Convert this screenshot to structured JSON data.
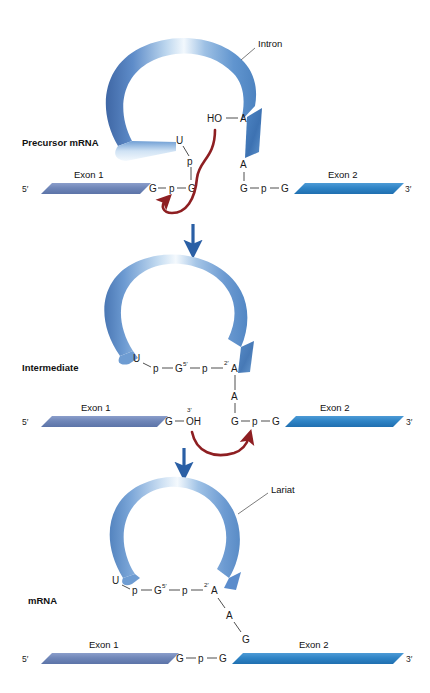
{
  "figure": {
    "background": "#ffffff"
  },
  "colors": {
    "exon1": "#6f86b8",
    "exon1_dark": "#5c74a8",
    "exon2": "#2f84c6",
    "exon2_dark": "#1f6fb0",
    "intron_mid": "#5b8ccc",
    "intron_dark": "#35609f",
    "intron_light": "#eaf2fb",
    "reaction_arrow": "#8e1f22",
    "step_arrow": "#2a5fa5",
    "text": "#111111",
    "bond": "#3b3b3b"
  },
  "stages": [
    {
      "id": "precursor",
      "label": "Precursor mRNA",
      "callout": "Intron",
      "left_terminus": "5′",
      "right_terminus": "3′",
      "exon1_label": "Exon 1",
      "exon2_label": "Exon 2",
      "branch_hydroxyl": "HO",
      "branch_base": "A",
      "branch_base_2": "A",
      "loop_nucleotides": [
        "U",
        "p",
        "G"
      ],
      "donor_chain": [
        "G",
        "p",
        "G"
      ],
      "acceptor_chain": [
        "G",
        "p",
        "G"
      ]
    },
    {
      "id": "intermediate",
      "label": "Intermediate",
      "left_terminus": "5′",
      "right_terminus": "3′",
      "exon1_label": "Exon 1",
      "exon2_label": "Exon 2",
      "lariat_chain": [
        "U",
        "p",
        "G",
        "p",
        "A"
      ],
      "lariat_sup_g": "5′",
      "lariat_sup_a": "2′",
      "branch_base_2": "A",
      "exon1_end": "G",
      "exon1_hydroxyl": "OH",
      "exon1_hydroxyl_sup": "3′",
      "acceptor_chain": [
        "G",
        "p",
        "G"
      ]
    },
    {
      "id": "mrna",
      "label": "mRNA",
      "callout": "Lariat",
      "left_terminus": "5′",
      "right_terminus": "3′",
      "exon1_label": "Exon 1",
      "exon2_label": "Exon 2",
      "lariat_chain": [
        "U",
        "p",
        "G",
        "p",
        "A"
      ],
      "lariat_sup_g": "5′",
      "lariat_sup_a": "2′",
      "branch_tail": [
        "A",
        "G"
      ],
      "spliced_chain": [
        "G",
        "p",
        "G"
      ]
    }
  ],
  "step_arrows": [
    {
      "id": "step-1",
      "from": "precursor",
      "to": "intermediate"
    },
    {
      "id": "step-2",
      "from": "intermediate",
      "to": "mrna"
    }
  ],
  "reaction_arrows": [
    {
      "id": "transesterification-1",
      "description": "branch-point 2'-OH attacks 5' splice site"
    },
    {
      "id": "transesterification-2",
      "description": "exon 1 3'-OH attacks 3' splice site"
    }
  ]
}
